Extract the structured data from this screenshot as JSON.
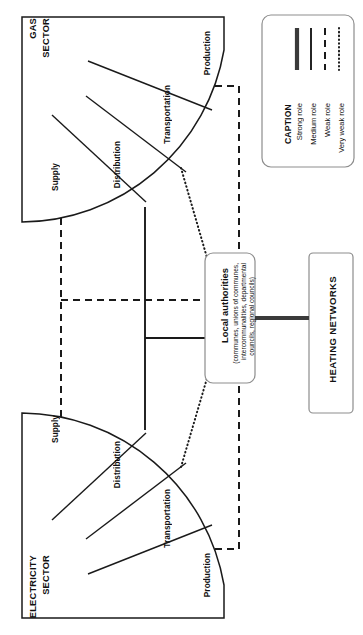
{
  "diagram": {
    "title_present": false,
    "sectors": [
      {
        "id": "gas",
        "name": "GAS\nSECTOR",
        "name_line1": "GAS",
        "name_line2": "SECTOR",
        "segments": [
          "Supply",
          "Distribution",
          "Transportation",
          "Production"
        ]
      },
      {
        "id": "electricity",
        "name_line1": "ELECTRICITY",
        "name_line2": "SECTOR",
        "segments": [
          "Supply",
          "Distribution",
          "Transportation",
          "Production"
        ]
      }
    ],
    "nodes": {
      "local_authorities": {
        "title": "Local authorities",
        "subtitle_lines": [
          "(communes, unions of communes,",
          "intercommunalities, departmental",
          "councils, regional councils)"
        ]
      },
      "heating_networks": {
        "title": "HEATING NETWORKS"
      }
    },
    "legend": {
      "title": "CAPTION",
      "items": [
        {
          "label": "Strong role",
          "style": "strong"
        },
        {
          "label": "Medium role",
          "style": "medium"
        },
        {
          "label": "Weak role",
          "style": "weak"
        },
        {
          "label": "Very weak role",
          "style": "very-weak"
        }
      ]
    },
    "links": [
      {
        "from": "gas.supply",
        "to": "electricity.supply",
        "role": "weak"
      },
      {
        "from": "gas.supply-trunk",
        "to": "local_authorities",
        "role": "weak"
      },
      {
        "from": "gas.distribution",
        "to": "electricity.distribution",
        "role": "medium"
      },
      {
        "from": "gas.distribution-trunk",
        "to": "local_authorities",
        "role": "medium"
      },
      {
        "from": "gas.transportation",
        "to": "local_authorities",
        "role": "very-weak"
      },
      {
        "from": "electricity.transportation",
        "to": "local_authorities",
        "role": "very-weak"
      },
      {
        "from": "gas.production",
        "to": "electricity.production",
        "role": "weak"
      },
      {
        "from": "local_authorities",
        "to": "heating_networks",
        "role": "strong"
      }
    ],
    "colors": {
      "line": "#1a1a1a",
      "strong_line": "#3a3a3a",
      "box_border": "#8d8d8d",
      "background": "#ffffff"
    }
  }
}
